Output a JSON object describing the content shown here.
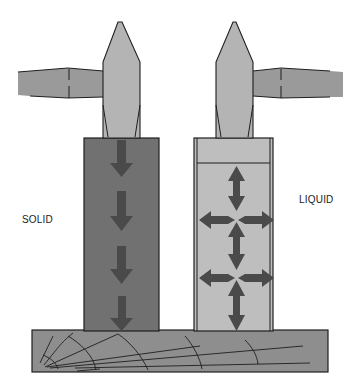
{
  "diagram": {
    "labels": {
      "solid": "SOLID",
      "liquid": "LIQUID"
    },
    "colors": {
      "hammer": "#b4b4b4",
      "hammer_handle": "#9a9a9a",
      "solid_column": "#717171",
      "liquid_column": "#bebebe",
      "arrow": "#4a4a4a",
      "base": "#8e8e8e",
      "outline": "#1e1e1e"
    },
    "solid_arrows": {
      "direction": "down",
      "count": 4
    },
    "liquid_arrows": {
      "direction": "all",
      "nodes": 2
    }
  }
}
